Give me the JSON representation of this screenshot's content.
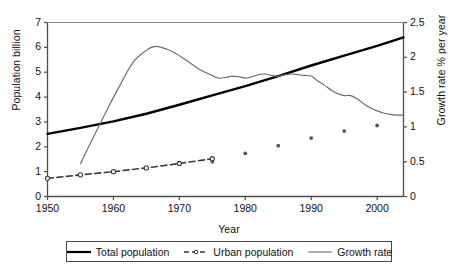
{
  "chart_data": {
    "type": "line",
    "title": "",
    "xlabel": "Year",
    "ylabel": "Population billion",
    "ylabel_secondary": "Growth rate % per year",
    "xlim": [
      1950,
      2004
    ],
    "ylim": [
      0,
      7
    ],
    "ylim_secondary": [
      0,
      2.5
    ],
    "grid": false,
    "legend_position": "bottom-center",
    "xticks": [
      1950,
      1960,
      1970,
      1980,
      1990,
      2000
    ],
    "xtick_labels": [
      "1950",
      "1960",
      "1970",
      "1980",
      "1990",
      "2000"
    ],
    "yticks": [
      0,
      1,
      2,
      3,
      4,
      5,
      6,
      7
    ],
    "ytick_labels": [
      "0",
      "1",
      "2",
      "3",
      "4",
      "5",
      "6",
      "7"
    ],
    "yticks_secondary": [
      0,
      0.5,
      1,
      1.5,
      2,
      2.5
    ],
    "ytick_labels_secondary": [
      "0",
      "0.5",
      "1",
      "1.5",
      "2",
      "2.5"
    ],
    "series": [
      {
        "name": "Total population",
        "axis": "left",
        "style": "solid-thick",
        "color": "#000000",
        "x": [
          1950,
          1955,
          1960,
          1965,
          1970,
          1975,
          1980,
          1985,
          1990,
          1995,
          2000,
          2004
        ],
        "values": [
          2.52,
          2.76,
          3.02,
          3.33,
          3.69,
          4.07,
          4.44,
          4.84,
          5.27,
          5.67,
          6.06,
          6.4
        ]
      },
      {
        "name": "Urban population",
        "axis": "left",
        "style": "dashed-marker",
        "color": "#3a3a3a",
        "x": [
          1950,
          1955,
          1960,
          1965,
          1970,
          1975
        ],
        "values": [
          0.73,
          0.87,
          1.0,
          1.15,
          1.33,
          1.52
        ]
      },
      {
        "name": "Growth rate",
        "axis": "right",
        "style": "solid-thin",
        "color": "#6b6b6b",
        "x": [
          1955,
          1957,
          1959,
          1961,
          1963,
          1965,
          1966,
          1967,
          1969,
          1971,
          1973,
          1975,
          1976,
          1977,
          1978,
          1979,
          1980,
          1981,
          1982,
          1983,
          1984,
          1985,
          1986,
          1987,
          1988,
          1989,
          1990,
          1991,
          1992,
          1993,
          1994,
          1995,
          1996,
          1997,
          1998,
          1999,
          2000,
          2001,
          2002,
          2003,
          2004
        ],
        "values": [
          0.47,
          0.86,
          1.24,
          1.6,
          1.93,
          2.1,
          2.15,
          2.15,
          2.08,
          1.96,
          1.83,
          1.74,
          1.7,
          1.71,
          1.73,
          1.72,
          1.7,
          1.72,
          1.75,
          1.76,
          1.74,
          1.73,
          1.75,
          1.76,
          1.75,
          1.74,
          1.73,
          1.66,
          1.6,
          1.53,
          1.48,
          1.45,
          1.45,
          1.4,
          1.33,
          1.27,
          1.23,
          1.2,
          1.18,
          1.17,
          1.17
        ]
      },
      {
        "name": "Urban population points",
        "axis": "right",
        "style": "scatter",
        "color": "#555555",
        "x": [
          1975,
          1980,
          1985,
          1990,
          1995,
          2000
        ],
        "values": [
          0.5,
          0.62,
          0.73,
          0.84,
          0.94,
          1.02
        ]
      }
    ],
    "legend": [
      {
        "label": "Total population",
        "style": "solid-thick",
        "color": "#000000"
      },
      {
        "label": "Urban population",
        "style": "dashed-marker",
        "color": "#3a3a3a"
      },
      {
        "label": "Growth rate",
        "style": "solid-thin",
        "color": "#6b6b6b"
      }
    ]
  }
}
